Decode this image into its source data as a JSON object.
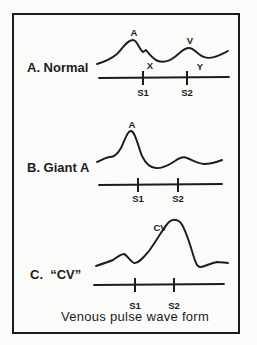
{
  "page": {
    "bg_color": "#fbfbf9",
    "ink_color": "#1c1c1c",
    "caption": "Venous pulse wave form"
  },
  "panels": [
    {
      "id": "normal",
      "label": "A. Normal",
      "wave_path": "M 97 64 C 104 62 111 59 117 54 C 123 48 127 40 133 40 C 137 40 139 49 143 52 L 146 50 C 150 55 153 59 158 61 C 164 63 170 61 176 56 C 181 52 184 48 189 48 C 194 48 198 55 204 57 C 211 60 220 55 228 51",
      "baseline": {
        "x1": 99,
        "y1": 78,
        "x2": 229,
        "y2": 77
      },
      "ticks": [
        {
          "x": 143,
          "y_top": 71,
          "y_bottom": 85,
          "label": "S1",
          "label_y": 96
        },
        {
          "x": 187,
          "y_top": 71,
          "y_bottom": 85,
          "label": "S2",
          "label_y": 96
        }
      ],
      "annotations": [
        {
          "text": "A",
          "x": 134,
          "y": 36
        },
        {
          "text": "X",
          "x": 150,
          "y": 69
        },
        {
          "text": "V",
          "x": 190,
          "y": 44
        },
        {
          "text": "Y",
          "x": 200,
          "y": 70
        }
      ]
    },
    {
      "id": "giant-a",
      "label": "B. Giant A",
      "wave_path": "M 97 162 C 102 160 106 157 110 157 C 114 157 117 155 121 148 C 125 140 127 131 131 131 C 135 131 138 146 142 156 C 146 164 151 168 156 168 C 162 169 169 165 175 161 C 179 158 183 156 187 158 C 192 160 198 164 204 164 C 211 164 217 162 222 160",
      "baseline": {
        "x1": 99,
        "y1": 185,
        "x2": 222,
        "y2": 184
      },
      "ticks": [
        {
          "x": 138,
          "y_top": 178,
          "y_bottom": 192,
          "label": "S1",
          "label_y": 202
        },
        {
          "x": 178,
          "y_top": 178,
          "y_bottom": 192,
          "label": "S2",
          "label_y": 202
        }
      ],
      "annotations": [
        {
          "text": "A",
          "x": 132,
          "y": 128
        }
      ]
    },
    {
      "id": "cv",
      "label": "C.  “CV”",
      "wave_path": "M 96 266 C 102 264 108 262 113 260 C 117 257 121 254 124 254 C 127 255 130 261 134 263 C 138 264 143 258 149 251 C 156 242 163 228 169 222 C 172 219 177 219 180 222 C 184 226 188 238 192 251 C 195 261 197 268 201 267 C 206 266 211 263 217 262 C 221 262 225 263 228 263",
      "baseline": {
        "x1": 94,
        "y1": 285,
        "x2": 224,
        "y2": 284
      },
      "ticks": [
        {
          "x": 135,
          "y_top": 278,
          "y_bottom": 292,
          "label": "S1",
          "label_y": 309
        },
        {
          "x": 174,
          "y_top": 278,
          "y_bottom": 292,
          "label": "S2",
          "label_y": 309
        }
      ],
      "annotations": [
        {
          "text": "CV",
          "x": 160,
          "y": 231
        }
      ]
    }
  ]
}
